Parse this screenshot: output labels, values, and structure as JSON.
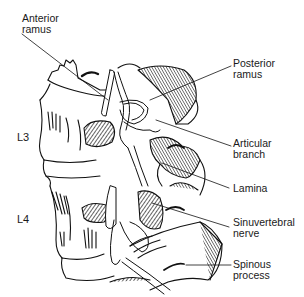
{
  "figure": {
    "vertebra_labels": [
      {
        "id": "l3",
        "text": "L3",
        "x": 17,
        "y": 131
      },
      {
        "id": "l4",
        "text": "L4",
        "x": 17,
        "y": 213
      }
    ],
    "callouts": [
      {
        "id": "anterior-ramus",
        "text": "Anterior\nramus",
        "x": 22,
        "y": 13,
        "line": [
          [
            22,
            34
          ],
          [
            108,
            100
          ]
        ]
      },
      {
        "id": "posterior-ramus",
        "text": "Posterior\nramus",
        "x": 233,
        "y": 58,
        "line": [
          [
            231,
            66
          ],
          [
            150,
            100
          ]
        ]
      },
      {
        "id": "articular-branch",
        "text": "Articular\nbranch",
        "x": 233,
        "y": 138,
        "line": [
          [
            231,
            146
          ],
          [
            156,
            120
          ]
        ]
      },
      {
        "id": "lamina",
        "text": "Lamina",
        "x": 233,
        "y": 183,
        "line": [
          [
            229,
            188
          ],
          [
            162,
            163
          ]
        ]
      },
      {
        "id": "sinuvertebral-nerve",
        "text": "Sinuvertebral\nnerve",
        "x": 233,
        "y": 217,
        "line": [
          [
            229,
            227
          ],
          [
            152,
            203
          ]
        ]
      },
      {
        "id": "spinous-process",
        "text": "Spinous\nprocess",
        "x": 233,
        "y": 259,
        "line": [
          [
            231,
            265
          ],
          [
            186,
            265
          ]
        ]
      }
    ],
    "colors": {
      "ink": "#111111",
      "background": "#ffffff"
    }
  }
}
